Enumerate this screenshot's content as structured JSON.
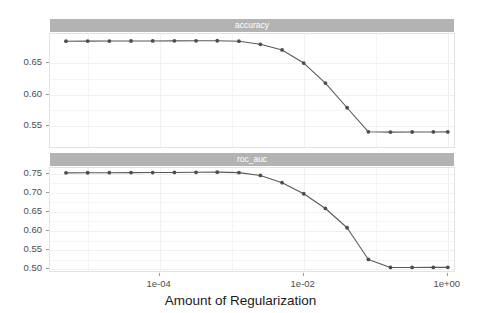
{
  "chart_data": [
    {
      "type": "line",
      "panel_label": "accuracy",
      "title": "accuracy",
      "xlabel": "Amount of Regularization",
      "ylabel": "",
      "xscale": "log10",
      "xlim": [
        3e-06,
        1.3
      ],
      "ylim": [
        0.513,
        0.697
      ],
      "yticks": [
        0.55,
        0.6,
        0.65
      ],
      "ytick_labels": [
        "0.55",
        "0.60",
        "0.65"
      ],
      "xticks": [
        0.0001,
        0.01,
        1.0
      ],
      "xtick_labels": [
        "1e-04",
        "1e-02",
        "1e+00"
      ],
      "grid": true,
      "legend": "none",
      "marker": "circle",
      "x": [
        5e-06,
        1e-05,
        2e-05,
        4e-05,
        8e-05,
        0.00016,
        0.00032,
        0.00063,
        0.00126,
        0.0025,
        0.005,
        0.01,
        0.02,
        0.04,
        0.079,
        0.16,
        0.32,
        0.63,
        1.0
      ],
      "y": [
        0.6855,
        0.6856,
        0.6857,
        0.6858,
        0.6859,
        0.686,
        0.6861,
        0.6862,
        0.6855,
        0.6805,
        0.6715,
        0.6505,
        0.6185,
        0.579,
        0.5405,
        0.54,
        0.5402,
        0.5403,
        0.5404
      ]
    },
    {
      "type": "line",
      "panel_label": "roc_auc",
      "title": "roc_auc",
      "xlabel": "Amount of Regularization",
      "ylabel": "",
      "xscale": "log10",
      "xlim": [
        3e-06,
        1.3
      ],
      "ylim": [
        0.49,
        0.765
      ],
      "yticks": [
        0.5,
        0.55,
        0.6,
        0.65,
        0.7,
        0.75
      ],
      "ytick_labels": [
        "0.50",
        "0.55",
        "0.60",
        "0.65",
        "0.70",
        "0.75"
      ],
      "xticks": [
        0.0001,
        0.01,
        1.0
      ],
      "xtick_labels": [
        "1e-04",
        "1e-02",
        "1e+00"
      ],
      "grid": true,
      "legend": "none",
      "marker": "circle",
      "x": [
        5e-06,
        1e-05,
        2e-05,
        4e-05,
        8e-05,
        0.00016,
        0.00032,
        0.00063,
        0.00126,
        0.0025,
        0.005,
        0.01,
        0.02,
        0.04,
        0.079,
        0.16,
        0.32,
        0.63,
        1.0
      ],
      "y": [
        0.7523,
        0.7525,
        0.7527,
        0.7529,
        0.7531,
        0.7534,
        0.7538,
        0.7541,
        0.753,
        0.7455,
        0.7265,
        0.6975,
        0.659,
        0.6085,
        0.5255,
        0.5045,
        0.5046,
        0.5047,
        0.5048
      ]
    }
  ],
  "axis": {
    "x_title": "Amount of Regularization"
  },
  "style": {
    "strip_fill": "#b3b3b3",
    "strip_text": "#ffffff",
    "panel_fill": "#ffffff",
    "panel_border": "#e3e3e3",
    "grid_color": "#f4f4f6",
    "line_color": "#595959",
    "point_color": "#4d4d4d",
    "axis_text": "#4d4d4d",
    "axis_title": "#1a1a1a"
  }
}
